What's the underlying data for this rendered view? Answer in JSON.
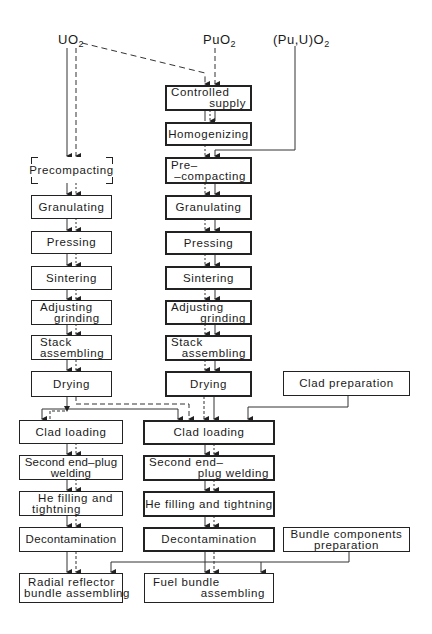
{
  "sources": {
    "uo2": {
      "base": "UO",
      "sub": "2"
    },
    "puo2": {
      "base": "PuO",
      "sub": "2"
    },
    "mixed": {
      "base": "(Pu,U)O",
      "sub": "2"
    }
  },
  "left_column": {
    "precompacting": "Precompacting",
    "granulating": "Granulating",
    "pressing": "Pressing",
    "sintering": "Sintering",
    "adjusting_grinding": {
      "l1": "Adjusting",
      "l2": "grinding"
    },
    "stack_assembling": {
      "l1": "Stack",
      "l2": "assembling"
    },
    "drying": "Drying"
  },
  "middle_column": {
    "controlled_supply": {
      "l1": "Controlled",
      "l2": "supply"
    },
    "homogenizing": "Homogenizing",
    "pre_compacting": {
      "l1": "Pre–",
      "l2": "–compacting"
    },
    "granulating": "Granulating",
    "pressing": "Pressing",
    "sintering": "Sintering",
    "adjusting_grinding": {
      "l1": "Adjusting",
      "l2": "grinding"
    },
    "stack_assembling": {
      "l1": "Stack",
      "l2": "assembling"
    },
    "drying": "Drying"
  },
  "clad_preparation": "Clad preparation",
  "lower_left": {
    "clad_loading": "Clad loading",
    "second_end_plug_welding": {
      "l1": "Second end–plug",
      "l2": "welding"
    },
    "he_filling": {
      "l1": "He filling and",
      "l2": "tightning"
    },
    "decontamination": "Decontamination",
    "radial_reflector": {
      "l1": "Radial reflector",
      "l2": "bundle assembling"
    }
  },
  "lower_middle": {
    "clad_loading": "Clad loading",
    "second_end_plug_welding": {
      "l1": "Second end–",
      "l2": "plug welding"
    },
    "he_filling": "He filling and tightning",
    "decontamination": "Decontamination",
    "fuel_bundle": {
      "l1": "Fuel bundle",
      "l2": "assembling"
    }
  },
  "bundle_components": {
    "l1": "Bundle components",
    "l2": "preparation"
  }
}
